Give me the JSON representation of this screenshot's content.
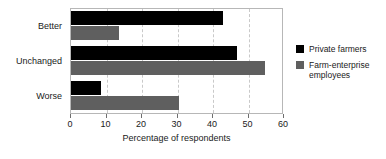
{
  "chart_data": {
    "type": "bar",
    "orientation": "horizontal",
    "title": "",
    "subtitle": "",
    "xlabel": "Percentage of respondents",
    "ylabel": "",
    "categories": [
      "Better",
      "Unchanged",
      "Worse"
    ],
    "series": [
      {
        "name": "Private farmers",
        "color": "#000000",
        "values": [
          42.8,
          46.7,
          8.5
        ]
      },
      {
        "name": "Farm-enterprise employees",
        "color": "#5f5f5f",
        "values": [
          13.6,
          54.6,
          30.4
        ]
      }
    ],
    "xlim": [
      0,
      60
    ],
    "xticks": [
      0,
      10,
      20,
      30,
      40,
      50,
      60
    ],
    "xtick_labels": [
      "0",
      "10",
      "20",
      "30",
      "40",
      "50",
      "60"
    ],
    "grid": "vertical-dashed",
    "legend_position": "right",
    "frame": true
  },
  "legend": {
    "entries": [
      {
        "label": "Private farmers"
      },
      {
        "label": "Farm-enterprise employees"
      }
    ]
  }
}
